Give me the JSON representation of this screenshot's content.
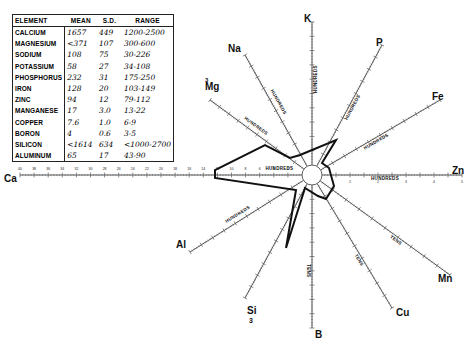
{
  "table": {
    "headers": [
      "ELEMENT",
      "MEAN",
      "S.D.",
      "RANGE"
    ],
    "rows": [
      {
        "element": "CALCIUM",
        "mean": "1657",
        "sd": "449",
        "range": "1200-2500"
      },
      {
        "element": "MAGNESIUM",
        "mean": "<371",
        "sd": "107",
        "range": "300-600"
      },
      {
        "element": "SODIUM",
        "mean": "108",
        "sd": "75",
        "range": "30-226"
      },
      {
        "element": "POTASSIUM",
        "mean": "58",
        "sd": "27",
        "range": "34-108"
      },
      {
        "element": "PHOSPHORUS",
        "mean": "232",
        "sd": "31",
        "range": "175-250"
      },
      {
        "element": "IRON",
        "mean": "128",
        "sd": "20",
        "range": "103-149"
      },
      {
        "element": "ZINC",
        "mean": "94",
        "sd": "12",
        "range": "79-112"
      },
      {
        "element": "MANGANESE",
        "mean": "17",
        "sd": "3.0",
        "range": "13-22"
      },
      {
        "element": "COPPER",
        "mean": "7.6",
        "sd": "1.0",
        "range": "6-9"
      },
      {
        "element": "BORON",
        "mean": "4",
        "sd": "0.6",
        "range": "3-5"
      },
      {
        "element": "SILICON",
        "mean": "<1614",
        "sd": "634",
        "range": "<1000-2700"
      },
      {
        "element": "ALUMINUM",
        "mean": "65",
        "sd": "17",
        "range": "43-90"
      }
    ]
  },
  "axes": [
    {
      "id": "K",
      "label": "K",
      "unit": "HUNDREDS",
      "max_label": "10"
    },
    {
      "id": "P",
      "label": "P",
      "unit": "HUNDREDS",
      "max_label": "10"
    },
    {
      "id": "Fe",
      "label": "Fe",
      "unit": "HUNDREDS",
      "max_label": "10"
    },
    {
      "id": "Zn",
      "label": "Zn",
      "unit": "HUNDREDS",
      "ticks": [
        "1",
        "2",
        "3",
        "4",
        "5"
      ]
    },
    {
      "id": "Mn",
      "label": "Mn",
      "unit": "TENS",
      "max_label": "10"
    },
    {
      "id": "Cu",
      "label": "Cu",
      "unit": "TENS"
    },
    {
      "id": "B",
      "label": "B",
      "unit": "TENS"
    },
    {
      "id": "Si",
      "label": "Si",
      "sub": "3",
      "unit": "",
      "ticks": [
        "1000",
        "10,000",
        "100,000"
      ]
    },
    {
      "id": "Al",
      "label": "Al",
      "unit": "HUNDREDS",
      "max_label": "10"
    },
    {
      "id": "Ca",
      "label": "Ca",
      "unit": "HUNDREDS",
      "ticks": [
        "2",
        "4",
        "6",
        "8",
        "10",
        "12",
        "14",
        "16",
        "18",
        "20",
        "22",
        "24",
        "26",
        "28",
        "30",
        "32",
        "34",
        "36",
        "38",
        "40"
      ]
    },
    {
      "id": "Mg",
      "label": "Mg",
      "sup": "3",
      "unit": "HUNDREDS"
    },
    {
      "id": "Na",
      "label": "Na",
      "unit": "HUNDREDS",
      "max_label": "10"
    }
  ],
  "chart_data": {
    "type": "radar",
    "title": "",
    "axes": [
      "K",
      "P",
      "Fe",
      "Zn",
      "Mn",
      "Cu",
      "B",
      "Si",
      "Al",
      "Ca",
      "Mg",
      "Na"
    ],
    "units": {
      "K": "hundreds",
      "P": "hundreds",
      "Fe": "hundreds",
      "Zn": "hundreds",
      "Mn": "tens",
      "Cu": "tens",
      "B": "tens",
      "Si": "log",
      "Al": "hundreds",
      "Ca": "hundreds",
      "Mg": "hundreds",
      "Na": "hundreds"
    },
    "values": {
      "K": 0.58,
      "P": 2.32,
      "Fe": 1.28,
      "Zn": 0.94,
      "Mn": 1.7,
      "Cu": 0.76,
      "B": 0.4,
      "Si": 1614,
      "Al": 0.65,
      "Ca": 16.57,
      "Mg": 3.71,
      "Na": 1.08
    }
  }
}
